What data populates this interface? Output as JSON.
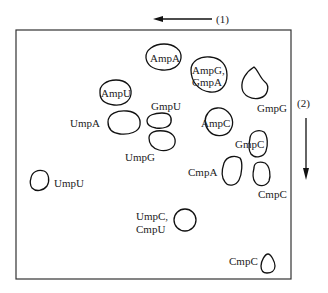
{
  "diagram": {
    "type": "two-dimensional chromatogram",
    "directions": [
      {
        "label": "(1)",
        "direction": "left"
      },
      {
        "label": "(2)",
        "direction": "down"
      }
    ],
    "spots": [
      {
        "id": "ampa",
        "label": "AmpA"
      },
      {
        "id": "ampu",
        "label": "AmpU"
      },
      {
        "id": "ampg-gmpa",
        "label_line1": "AmpG,",
        "label_line2": "GmpA"
      },
      {
        "id": "gmpg",
        "label": "GmpG"
      },
      {
        "id": "gmpu",
        "label": "GmpU"
      },
      {
        "id": "umpa",
        "label": "UmpA"
      },
      {
        "id": "umpg",
        "label": "UmpG"
      },
      {
        "id": "ampc",
        "label": "AmpC"
      },
      {
        "id": "gmpc",
        "label": "GmpC"
      },
      {
        "id": "cmpa",
        "label": "CmpA"
      },
      {
        "id": "cmpc-upper",
        "label": "CmpC"
      },
      {
        "id": "umpu",
        "label": "UmpU"
      },
      {
        "id": "umpc-cmpu",
        "label_line1": "UmpC,",
        "label_line2": "CmpU"
      },
      {
        "id": "cmpc-lower",
        "label": "CmpC"
      }
    ]
  }
}
